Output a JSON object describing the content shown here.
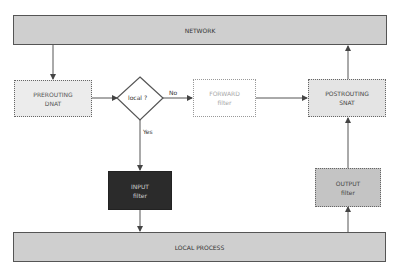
{
  "diagram": {
    "bars": {
      "network": {
        "label": "NETWORK"
      },
      "local_process": {
        "label": "LOCAL PROCESS"
      }
    },
    "nodes": {
      "prerouting": {
        "line1": "PREROUTING",
        "line2": "DNAT"
      },
      "decision": {
        "label": "local ?"
      },
      "forward": {
        "line1": "FORWARD",
        "line2": "filter"
      },
      "postrouting": {
        "line1": "POSTROUTING",
        "line2": "SNAT"
      },
      "input": {
        "line1": "INPUT",
        "line2": "filter"
      },
      "output": {
        "line1": "OUTPUT",
        "line2": "filter"
      }
    },
    "edges": {
      "no_label": "No",
      "yes_label": "Yes"
    },
    "colors": {
      "bar_fill": "#cfcfcf",
      "light_box_fill": "#ececec",
      "forward_text": "#a8a8a8",
      "input_fill": "#2b2b2b",
      "output_fill": "#c4c4c4",
      "line": "#555555"
    }
  }
}
